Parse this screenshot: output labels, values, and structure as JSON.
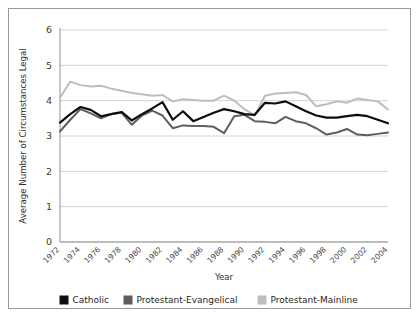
{
  "chart_data": {
    "type": "line",
    "title": "",
    "xlabel": "Year",
    "ylabel": "Average Number of Circumstances Legal",
    "xlim": [
      1972,
      2004
    ],
    "ylim": [
      0,
      6
    ],
    "ytick_labels": [
      "0",
      "1",
      "2",
      "3",
      "4",
      "5",
      "6"
    ],
    "yticks": [
      0,
      1,
      2,
      3,
      4,
      5,
      6
    ],
    "xtick_labels": [
      "1972",
      "1974",
      "1976",
      "1978",
      "1980",
      "1982",
      "1984",
      "1986",
      "1988",
      "1990",
      "1992",
      "1994",
      "1996",
      "1998",
      "2000",
      "2002",
      "2004"
    ],
    "xticks": [
      1972,
      1974,
      1976,
      1978,
      1980,
      1982,
      1984,
      1986,
      1988,
      1990,
      1992,
      1994,
      1996,
      1998,
      2000,
      2002,
      2004
    ],
    "grid": true,
    "legend_position": "bottom",
    "x": [
      1972,
      1973,
      1974,
      1975,
      1976,
      1977,
      1978,
      1979,
      1980,
      1981,
      1982,
      1983,
      1984,
      1985,
      1986,
      1987,
      1988,
      1989,
      1990,
      1991,
      1992,
      1993,
      1994,
      1995,
      1996,
      1997,
      1998,
      1999,
      2000,
      2001,
      2002,
      2003,
      2004
    ],
    "series": [
      {
        "name": "Catholic",
        "color": "#0d0d0d",
        "width": 2.2,
        "values": [
          3.38,
          3.62,
          3.82,
          3.74,
          3.56,
          3.62,
          3.68,
          3.44,
          3.62,
          3.78,
          3.96,
          3.46,
          3.7,
          3.42,
          3.54,
          3.66,
          3.76,
          3.7,
          3.62,
          3.6,
          3.94,
          3.92,
          3.98,
          3.84,
          3.7,
          3.58,
          3.52,
          3.52,
          3.56,
          3.6,
          3.56,
          3.46,
          3.36
        ]
      },
      {
        "name": "Protestant-Evangelical",
        "color": "#5e5e5e",
        "width": 2.0,
        "values": [
          3.13,
          3.46,
          3.76,
          3.64,
          3.5,
          3.62,
          3.66,
          3.32,
          3.58,
          3.72,
          3.58,
          3.22,
          3.3,
          3.28,
          3.28,
          3.26,
          3.08,
          3.56,
          3.6,
          3.42,
          3.4,
          3.36,
          3.54,
          3.42,
          3.36,
          3.22,
          3.04,
          3.1,
          3.2,
          3.04,
          3.02,
          3.06,
          3.1
        ]
      },
      {
        "name": "Protestant-Mainline",
        "color": "#bdbdbd",
        "width": 2.0,
        "values": [
          4.08,
          4.54,
          4.44,
          4.4,
          4.42,
          4.34,
          4.28,
          4.22,
          4.18,
          4.14,
          4.16,
          3.98,
          4.04,
          4.02,
          4.0,
          4.0,
          4.14,
          4.0,
          3.76,
          3.58,
          4.14,
          4.2,
          4.22,
          4.24,
          4.16,
          3.84,
          3.9,
          3.98,
          3.94,
          4.06,
          4.02,
          3.98,
          3.75
        ]
      }
    ]
  },
  "legend": {
    "items": [
      {
        "label": "Catholic",
        "color": "#0d0d0d"
      },
      {
        "label": "Protestant-Evangelical",
        "color": "#5e5e5e"
      },
      {
        "label": "Protestant-Mainline",
        "color": "#bdbdbd"
      }
    ]
  }
}
